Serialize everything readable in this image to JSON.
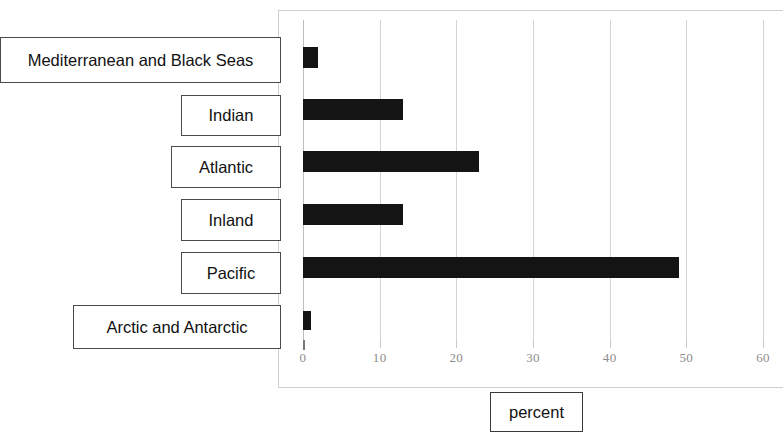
{
  "chart_data": {
    "type": "bar",
    "orientation": "horizontal",
    "title": "",
    "xlabel": "percent",
    "ylabel": "",
    "xlim": [
      0,
      60
    ],
    "xticks": [
      "0",
      "10",
      "20",
      "30",
      "40",
      "50",
      "60"
    ],
    "xtick_values": [
      0,
      10,
      20,
      30,
      40,
      50,
      60
    ],
    "grid": "vertical",
    "legend": "none",
    "bar_color": "#141414",
    "categories": [
      "Mediterranean and Black Seas",
      "Indian",
      "Atlantic",
      "Inland",
      "Pacific",
      "Arctic and Antarctic"
    ],
    "values": [
      2,
      13,
      23,
      13,
      49,
      1
    ],
    "series": [
      {
        "name": "percent",
        "values": [
          2,
          13,
          23,
          13,
          49,
          1
        ]
      }
    ]
  },
  "axis": {
    "title": "percent",
    "ticks": [
      {
        "label": "0",
        "value": 0
      },
      {
        "label": "10",
        "value": 10
      },
      {
        "label": "20",
        "value": 20
      },
      {
        "label": "30",
        "value": 30
      },
      {
        "label": "40",
        "value": 40
      },
      {
        "label": "50",
        "value": 50
      },
      {
        "label": "60",
        "value": 60
      }
    ]
  },
  "category_labels": [
    {
      "label": "Mediterranean and Black Seas"
    },
    {
      "label": "Indian"
    },
    {
      "label": "Atlantic"
    },
    {
      "label": "Inland"
    },
    {
      "label": "Pacific"
    },
    {
      "label": "Arctic and Antarctic"
    }
  ]
}
